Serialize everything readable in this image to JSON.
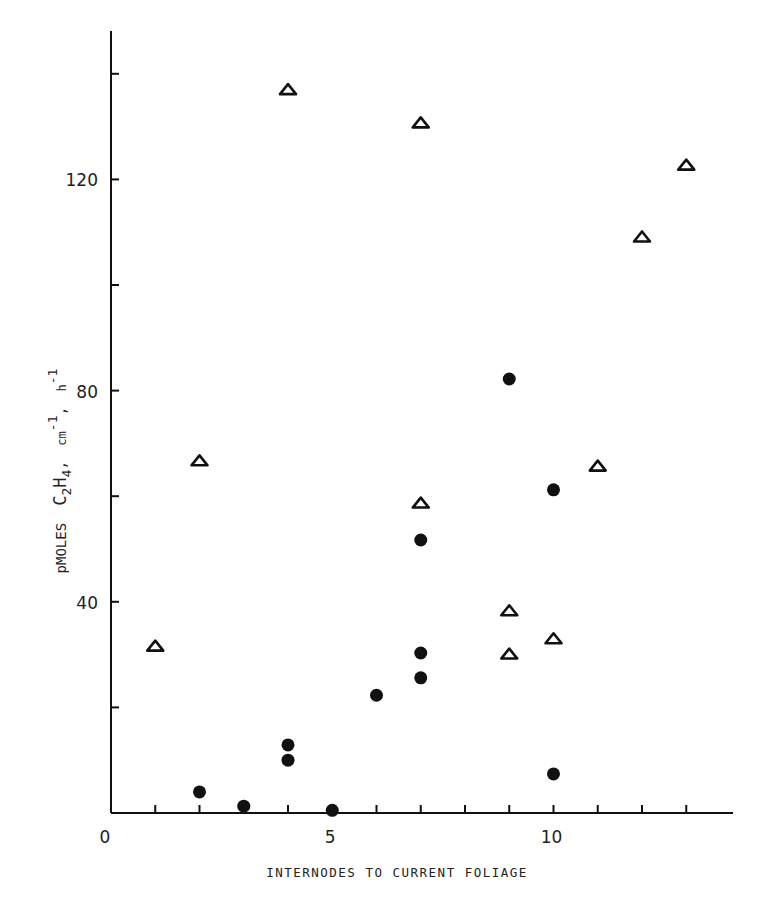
{
  "chart_data": {
    "type": "scatter",
    "title": "",
    "xlabel": "INTERNODES TO CURRENT FOLIAGE",
    "ylabel": "pMOLES C2H4, cm-1, h-1",
    "ylabel_parts": {
      "pre": "pMOLES",
      "formula_c": "C",
      "formula_c_sub": "2",
      "formula_h": "H",
      "formula_h_sub": "4",
      "sep1": ",",
      "cm": "cm",
      "cm_sup": "-1",
      "sep2": ",",
      "h": "h",
      "h_sup": "-1"
    },
    "xlim": [
      0,
      14.2
    ],
    "ylim": [
      0,
      146
    ],
    "x_ticks": [
      1,
      2,
      3,
      4,
      5,
      6,
      7,
      8,
      9,
      10,
      11,
      12,
      13
    ],
    "x_tick_labels": [
      {
        "value": 0,
        "label": "0"
      },
      {
        "value": 5,
        "label": "5"
      },
      {
        "value": 10,
        "label": "10"
      }
    ],
    "y_ticks": [
      20,
      40,
      60,
      80,
      100,
      120,
      140
    ],
    "y_tick_labels": [
      {
        "value": 40,
        "label": "40"
      },
      {
        "value": 80,
        "label": "80"
      },
      {
        "value": 120,
        "label": "120"
      }
    ],
    "grid": false,
    "legend": null,
    "series": [
      {
        "name": "open triangles",
        "marker": "open-triangle",
        "color": "#111111",
        "points": [
          {
            "x": 1,
            "y": 31.6
          },
          {
            "x": 2,
            "y": 66.7
          },
          {
            "x": 4,
            "y": 137.0
          },
          {
            "x": 7,
            "y": 130.7
          },
          {
            "x": 7,
            "y": 58.7
          },
          {
            "x": 9,
            "y": 38.3
          },
          {
            "x": 9,
            "y": 30.1
          },
          {
            "x": 10,
            "y": 33.0
          },
          {
            "x": 11,
            "y": 65.7
          },
          {
            "x": 12,
            "y": 109.1
          },
          {
            "x": 13,
            "y": 122.7
          }
        ]
      },
      {
        "name": "filled circles",
        "marker": "filled-circle",
        "color": "#111111",
        "points": [
          {
            "x": 2,
            "y": 4.0
          },
          {
            "x": 3,
            "y": 1.3
          },
          {
            "x": 4,
            "y": 12.9
          },
          {
            "x": 4,
            "y": 10.0
          },
          {
            "x": 5,
            "y": 0.5
          },
          {
            "x": 6,
            "y": 22.3
          },
          {
            "x": 7,
            "y": 51.7
          },
          {
            "x": 7,
            "y": 30.3
          },
          {
            "x": 7,
            "y": 25.6
          },
          {
            "x": 9,
            "y": 82.2
          },
          {
            "x": 10,
            "y": 61.2
          },
          {
            "x": 10,
            "y": 7.4
          }
        ]
      }
    ]
  }
}
